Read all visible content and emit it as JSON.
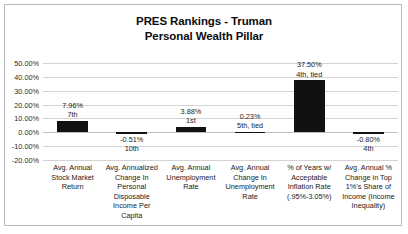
{
  "chart_data": {
    "type": "bar",
    "title": "PRES Rankings - Truman\nPersonal Wealth Pillar",
    "title_line1": "PRES Rankings - Truman",
    "title_line2": "Personal Wealth Pillar",
    "xlabel": "",
    "ylabel": "",
    "ylim": [
      -20,
      50
    ],
    "ytick_values": [
      50,
      40,
      30,
      20,
      10,
      0,
      -10,
      -20
    ],
    "ytick_labels": [
      "50.00%",
      "40.00%",
      "30.00%",
      "20.00%",
      "10.00%",
      "0.00%",
      "-10.00%",
      "-20.00%"
    ],
    "grid": true,
    "legend": "none",
    "bar_color": "#111111",
    "gridline_color": "#d3d3d3",
    "categories": [
      "Avg. Annual Stock Market Return",
      "Avg. Annualized Change In Personal Disposable Income Per Capita",
      "Avg. Annual Unemployment Rate",
      "Avg. Annual Change In Unemployment Rate",
      "% of Years w/ Acceptable Inflation Rate (.95%-3.05%)",
      "Avg. Annual % Change in Top 1%'s Share of Income (Income Inequality)"
    ],
    "values": [
      7.96,
      -0.51,
      3.88,
      0.23,
      37.5,
      -0.8
    ],
    "value_labels": [
      "7.96%",
      "-0.51%",
      "3.88%",
      "0.23%",
      "37.50%",
      "-0.80%"
    ],
    "rank_labels": [
      "7th",
      "10th",
      "1st",
      "5th, tied",
      "4th, tied",
      "4th"
    ]
  },
  "categories_lines": [
    [
      "Avg. Annual",
      "Stock Market",
      "Return"
    ],
    [
      "Avg. Annualized",
      "Change In",
      "Personal",
      "Disposable",
      "Income Per",
      "Capita"
    ],
    [
      "Avg. Annual",
      "Unemployment",
      "Rate"
    ],
    [
      "Avg. Annual",
      "Change In",
      "Unemployment",
      "Rate"
    ],
    [
      "% of Years w/",
      "Acceptable",
      "Inflation Rate",
      "(.95%-3.05%)"
    ],
    [
      "Avg. Annual %",
      "Change in Top",
      "1%'s Share of",
      "Income (Income",
      "Inequality)"
    ]
  ]
}
